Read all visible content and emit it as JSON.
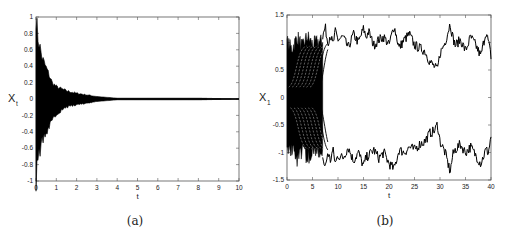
{
  "chart_data": [
    {
      "type": "line",
      "panel": "(a)",
      "title": "",
      "xlabel": "t",
      "ylabel": "X_t",
      "xlim": [
        0,
        10
      ],
      "ylim": [
        -1,
        1
      ],
      "xticks": [
        0,
        1,
        2,
        3,
        4,
        5,
        6,
        7,
        8,
        9,
        10
      ],
      "yticks": [
        -1,
        -0.8,
        -0.6,
        -0.4,
        -0.2,
        0,
        0.2,
        0.4,
        0.6,
        0.8,
        1
      ],
      "grid": false,
      "legend": null,
      "description": "Many trajectories starting in [-1,1] that converge to 0; envelope shrinks from ±1 at t=0 to ≈±0.1 at t≈1.5 and ≈0 by t≈4",
      "envelope": {
        "t": [
          0,
          0.1,
          0.3,
          0.5,
          0.8,
          1.0,
          1.5,
          2.0,
          2.5,
          3.0,
          3.5,
          4.0,
          5,
          6,
          7,
          8,
          9,
          10
        ],
        "upper": [
          1.0,
          0.75,
          0.5,
          0.38,
          0.2,
          0.15,
          0.1,
          0.07,
          0.05,
          0.03,
          0.02,
          0.01,
          0.01,
          0.01,
          0.01,
          0.01,
          0.005,
          0.0
        ],
        "lower": [
          -1.0,
          -0.75,
          -0.5,
          -0.42,
          -0.28,
          -0.18,
          -0.1,
          -0.07,
          -0.05,
          -0.03,
          -0.02,
          -0.01,
          -0.01,
          -0.01,
          -0.01,
          -0.01,
          -0.005,
          0.0
        ]
      }
    },
    {
      "type": "line",
      "panel": "(b)",
      "title": "",
      "xlabel": "t",
      "ylabel": "X_t",
      "xlim": [
        0,
        40
      ],
      "ylim": [
        -1.5,
        1.5
      ],
      "xticks": [
        0,
        5,
        10,
        15,
        20,
        25,
        30,
        35,
        40
      ],
      "yticks": [
        -1.5,
        -1,
        -0.5,
        0,
        0.5,
        1,
        1.5
      ],
      "grid": false,
      "legend": null,
      "description": "Trajectories split from a dense bundle near 0 into two noisy branches fluctuating around +1 and -1 after t≈7",
      "series": [
        {
          "name": "upper branch",
          "t": [
            7,
            7.5,
            8,
            8.5,
            9,
            9.5,
            10,
            11,
            12,
            13,
            14,
            15,
            15.5,
            16,
            17,
            18,
            19,
            20,
            21,
            22,
            23,
            24,
            25,
            26,
            27,
            28,
            29,
            29.5,
            30,
            31,
            32,
            32.5,
            33,
            34,
            35,
            36,
            37,
            38,
            39,
            39.5,
            40
          ],
          "values": [
            1.1,
            1.28,
            1.0,
            1.15,
            0.95,
            1.2,
            1.05,
            1.1,
            0.9,
            1.15,
            1.0,
            1.25,
            1.1,
            1.2,
            0.95,
            1.05,
            1.1,
            0.95,
            1.3,
            0.9,
            1.05,
            1.15,
            0.95,
            0.9,
            0.85,
            0.65,
            0.55,
            0.5,
            0.8,
            1.0,
            1.35,
            1.1,
            0.95,
            1.05,
            0.85,
            1.1,
            0.95,
            0.75,
            1.2,
            1.0,
            0.75
          ]
        },
        {
          "name": "lower branch",
          "t": [
            7,
            7.5,
            8,
            8.5,
            9,
            9.5,
            10,
            11,
            12,
            13,
            14,
            15,
            15.5,
            16,
            17,
            18,
            19,
            20,
            21,
            22,
            23,
            24,
            25,
            26,
            27,
            28,
            29,
            29.5,
            30,
            31,
            32,
            32.5,
            33,
            34,
            35,
            36,
            37,
            38,
            39,
            39.5,
            40
          ],
          "values": [
            -1.1,
            -1.28,
            -1.0,
            -1.15,
            -0.95,
            -1.2,
            -1.05,
            -1.1,
            -0.9,
            -1.15,
            -1.0,
            -1.25,
            -1.1,
            -1.05,
            -0.95,
            -1.1,
            -1.0,
            -1.2,
            -1.3,
            -0.95,
            -1.0,
            -0.9,
            -0.95,
            -0.85,
            -0.8,
            -0.65,
            -0.6,
            -0.48,
            -0.8,
            -1.0,
            -1.35,
            -1.05,
            -0.95,
            -0.85,
            -1.0,
            -0.9,
            -1.05,
            -1.2,
            -0.95,
            -1.0,
            -0.7
          ]
        }
      ],
      "bundle_envelope": {
        "t": [
          0,
          1,
          2,
          3,
          4,
          5,
          6,
          7
        ],
        "upper": [
          1.1,
          0.95,
          1.2,
          1.0,
          1.2,
          1.05,
          1.1,
          1.1
        ],
        "lower": [
          -1.1,
          -1.0,
          -1.2,
          -1.05,
          -1.2,
          -1.05,
          -1.1,
          -1.1
        ]
      }
    }
  ],
  "captions": {
    "a": "(a)",
    "b": "(b)"
  },
  "axes": {
    "a": {
      "xlabel": "t",
      "ylabel_main": "X",
      "ylabel_sub": "t"
    },
    "b": {
      "xlabel": "t",
      "ylabel_main": "X",
      "ylabel_sub": "1"
    }
  }
}
